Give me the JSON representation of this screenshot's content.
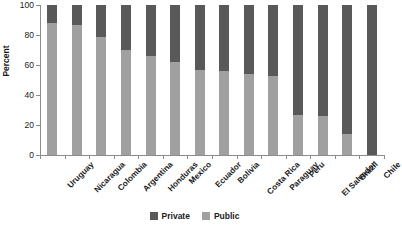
{
  "chart_data": {
    "type": "bar",
    "subtype": "stacked-100-percent",
    "title": "",
    "xlabel": "",
    "ylabel": "Percent",
    "ylim": [
      0,
      100
    ],
    "yticks": [
      0,
      20,
      40,
      60,
      80,
      100
    ],
    "grid": false,
    "legend_position": "bottom-center",
    "categories": [
      "Uruguay",
      "Nicaragua",
      "Colombia",
      "Argentina",
      "Honduras",
      "Mexico",
      "Ecuador",
      "Bolivia",
      "Costa Rica",
      "Paraguay",
      "Peru",
      "El Salvador",
      "Brazil",
      "Chile"
    ],
    "series": [
      {
        "name": "Public",
        "color": "#a0a0a0",
        "values": [
          88,
          87,
          79,
          70,
          66,
          62,
          57,
          56,
          54,
          53,
          27,
          26,
          14,
          0
        ]
      },
      {
        "name": "Private",
        "color": "#595959",
        "values": [
          12,
          13,
          21,
          30,
          34,
          38,
          43,
          44,
          46,
          47,
          73,
          74,
          86,
          100
        ]
      }
    ]
  },
  "legend": {
    "items": [
      {
        "label": "Private",
        "color": "#595959"
      },
      {
        "label": "Public",
        "color": "#a0a0a0"
      }
    ]
  },
  "axes": {
    "y_title": "Percent",
    "y_tick_labels": [
      "0",
      "20",
      "40",
      "60",
      "80",
      "100"
    ]
  }
}
